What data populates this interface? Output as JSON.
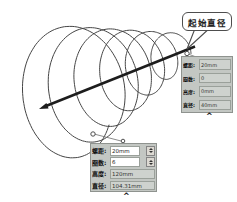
{
  "callout": {
    "label": "起始直径"
  },
  "panels": {
    "start": {
      "rows": [
        {
          "label": "螺距:",
          "value": "20mm"
        },
        {
          "label": "圈数:",
          "value": "0"
        },
        {
          "label": "高度:",
          "value": "0mm"
        },
        {
          "label": "直径:",
          "value": "40mm"
        }
      ],
      "collapse": "^"
    },
    "end": {
      "rows": [
        {
          "label": "螺距:",
          "value": "20mm"
        },
        {
          "label": "圈数:",
          "value": "6"
        },
        {
          "label": "高度:",
          "value": "120mm"
        },
        {
          "label": "直径:",
          "value": "104.31mm"
        }
      ],
      "collapse": "^"
    }
  },
  "colors": {
    "panel_bg": "#c3c7c3",
    "readonly_field_bg": "#ced2ce",
    "editable_field_bg": "#ffffff",
    "line": "#454545",
    "axis": "#1d1d1d",
    "callout_border": "#4e4e4e"
  }
}
